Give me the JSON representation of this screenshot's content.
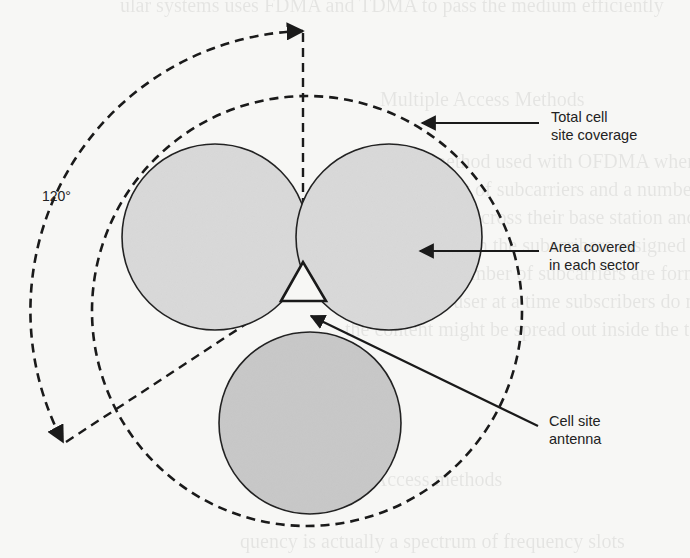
{
  "diagram": {
    "title": "",
    "angle_label": "120°",
    "labels": {
      "total_coverage": [
        "Total cell",
        "site coverage"
      ],
      "sector_area": [
        "Area covered",
        "in each sector"
      ],
      "antenna": [
        "Cell site",
        "antenna"
      ]
    },
    "colors": {
      "background": "#f7f7f5",
      "sector_fill": "#d6d6d6",
      "stroke": "#1a1a1a",
      "text": "#222222"
    },
    "geometry": {
      "outer_circle": {
        "cx": 307,
        "cy": 311,
        "r": 215
      },
      "sector_circles": [
        {
          "cx": 217,
          "cy": 237,
          "r": 93
        },
        {
          "cx": 388,
          "cy": 237,
          "r": 93
        },
        {
          "cx": 307,
          "cy": 423,
          "r": 91
        }
      ],
      "antenna_triangle": [
        [
          281,
          301
        ],
        [
          303,
          262
        ],
        [
          325,
          301
        ]
      ],
      "sector_count": 3,
      "sector_angle_deg": 120
    }
  }
}
